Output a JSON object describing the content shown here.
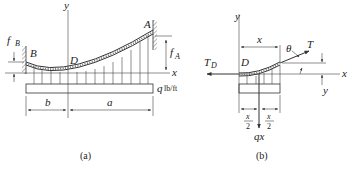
{
  "figure_a": {
    "caption": "(a)",
    "labels": {
      "y_axis": "y",
      "x_axis": "x",
      "point_A": "A",
      "point_B": "B",
      "point_D": "D",
      "sag_B": "f",
      "sag_B_sub": "B",
      "sag_A": "f",
      "sag_A_sub": "A",
      "load": "q",
      "load_unit": "lb/ft",
      "span_b": "b",
      "span_a": "a"
    }
  },
  "figure_b": {
    "caption": "(b)",
    "labels": {
      "y_axis": "y",
      "x_axis": "x",
      "x_dim": "x",
      "point_D": "D",
      "tension_D": "T",
      "tension_D_sub": "D",
      "tension": "T",
      "angle": "θ",
      "y_dim": "y",
      "half_left_num": "x",
      "half_left_den": "2",
      "half_right_num": "x",
      "half_right_den": "2",
      "resultant": "qx"
    }
  },
  "colors": {
    "ink": "#333333",
    "background": "#ffffff"
  }
}
